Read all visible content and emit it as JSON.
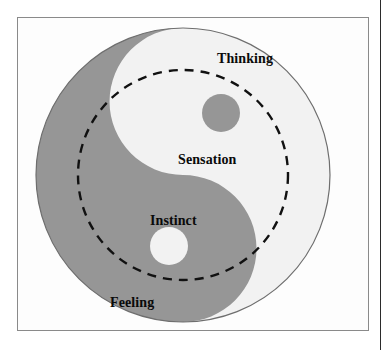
{
  "figure": {
    "kind": "taijitu-diagram",
    "title_visible": false,
    "colors": {
      "dark_half": "#969696",
      "light_half": "#f2f2f2",
      "page_background": "#ffffff",
      "frame_background": "#fdfdfd",
      "frame_border": "#8a8a8a",
      "outline": "#6e6e6e",
      "dashed_circle": "#111111",
      "label_text": "#0a0a0a",
      "page_edge_rule": "#2b2b2b"
    },
    "geometry": {
      "frame": {
        "x": 17,
        "y": 17,
        "width": 352,
        "height": 314
      },
      "outer_circle": {
        "cx": 182,
        "cy": 174,
        "r": 148
      },
      "dashed_circle": {
        "cx": 182,
        "cy": 174,
        "r": 105,
        "dash": "9 7"
      },
      "dark_eye": {
        "cx": 220,
        "cy": 112,
        "r": 19
      },
      "light_eye": {
        "cx": 168,
        "cy": 245,
        "r": 19
      },
      "page_edge_rule": {
        "x": 380,
        "y": 0,
        "width": 1,
        "height": 350
      }
    },
    "labels": [
      {
        "id": "thinking",
        "text": "Thinking",
        "region": "light-outer-top"
      },
      {
        "id": "sensation",
        "text": "Sensation",
        "region": "light-inner"
      },
      {
        "id": "instinct",
        "text": "Instinct",
        "region": "dark-inner"
      },
      {
        "id": "feeling",
        "text": "Feeling",
        "region": "dark-outer-bottom"
      }
    ]
  }
}
